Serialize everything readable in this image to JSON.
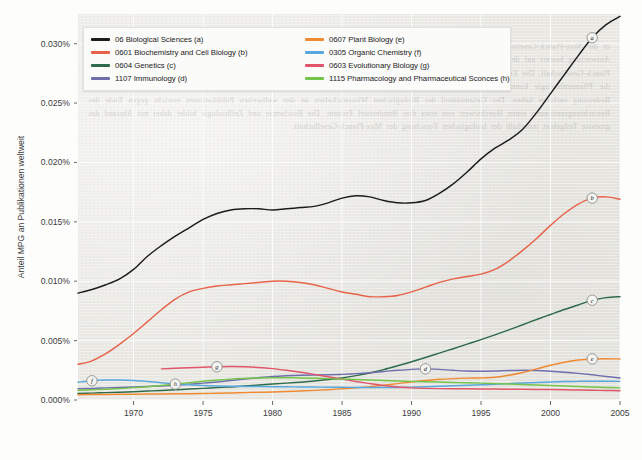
{
  "chart_data": {
    "type": "line",
    "title": "",
    "xlabel": "",
    "ylabel": "Anteil MPG an Publikationen weltweit",
    "xlim": [
      1966,
      2005
    ],
    "ylim": [
      0.0,
      0.0325
    ],
    "grid": true,
    "legend_position": "top-left inside plot",
    "x_ticks": [
      "1970",
      "1975",
      "1980",
      "1985",
      "1990",
      "1995",
      "2000",
      "2005"
    ],
    "x_tick_values": [
      1970,
      1975,
      1980,
      1985,
      1990,
      1995,
      2000,
      2005
    ],
    "y_ticks": [
      "0.000%",
      "0.005%",
      "0.010%",
      "0.015%",
      "0.020%",
      "0.025%",
      "0.030%"
    ],
    "y_tick_values": [
      0.0,
      0.005,
      0.01,
      0.015,
      0.02,
      0.025,
      0.03
    ],
    "x": [
      1966,
      1967,
      1968,
      1969,
      1970,
      1971,
      1972,
      1973,
      1974,
      1975,
      1976,
      1977,
      1978,
      1979,
      1980,
      1981,
      1982,
      1983,
      1984,
      1985,
      1986,
      1987,
      1988,
      1989,
      1990,
      1991,
      1992,
      1993,
      1994,
      1995,
      1996,
      1997,
      1998,
      1999,
      2000,
      2001,
      2002,
      2003,
      2004,
      2005
    ],
    "series": [
      {
        "key": "a",
        "name": "06 Biological Sciences (a)",
        "code": "06",
        "label_letter": "a",
        "color": "#1c1c1c",
        "marker_at": 2003,
        "values": [
          0.009,
          0.0093,
          0.0097,
          0.0102,
          0.011,
          0.0121,
          0.013,
          0.0138,
          0.0145,
          0.0152,
          0.0157,
          0.016,
          0.0161,
          0.0161,
          0.016,
          0.0161,
          0.0162,
          0.0163,
          0.0166,
          0.017,
          0.0172,
          0.0171,
          0.0168,
          0.0166,
          0.0166,
          0.0168,
          0.0174,
          0.0182,
          0.0192,
          0.0203,
          0.0212,
          0.0219,
          0.0228,
          0.0242,
          0.0258,
          0.0274,
          0.029,
          0.0305,
          0.0316,
          0.0323
        ]
      },
      {
        "key": "b",
        "name": "0601 Biochemistry and Cell Biology (b)",
        "code": "0601",
        "label_letter": "b",
        "color": "#e8624a",
        "marker_at": 2003,
        "values": [
          0.003,
          0.0033,
          0.0039,
          0.0047,
          0.0056,
          0.0066,
          0.0076,
          0.0085,
          0.0091,
          0.0094,
          0.0096,
          0.0097,
          0.0098,
          0.0099,
          0.01,
          0.01,
          0.0099,
          0.0097,
          0.0094,
          0.0091,
          0.0089,
          0.0087,
          0.0087,
          0.0088,
          0.0091,
          0.0095,
          0.0099,
          0.0102,
          0.0104,
          0.0106,
          0.011,
          0.0117,
          0.0126,
          0.0136,
          0.0147,
          0.0157,
          0.0165,
          0.017,
          0.0171,
          0.0169
        ]
      },
      {
        "key": "c",
        "name": "0604 Genetics (c)",
        "code": "0604",
        "label_letter": "c",
        "color": "#2e6b4a",
        "marker_at": 2003,
        "values": [
          0.00055,
          0.00058,
          0.00062,
          0.00066,
          0.0007,
          0.00075,
          0.0008,
          0.00086,
          0.00092,
          0.00098,
          0.00104,
          0.0011,
          0.00118,
          0.00126,
          0.00134,
          0.00142,
          0.0015,
          0.0016,
          0.00172,
          0.00186,
          0.00205,
          0.00228,
          0.00256,
          0.00288,
          0.00322,
          0.00358,
          0.00395,
          0.00432,
          0.0047,
          0.00508,
          0.00548,
          0.0059,
          0.00634,
          0.00678,
          0.0072,
          0.00762,
          0.008,
          0.0084,
          0.00862,
          0.0087
        ]
      },
      {
        "key": "d",
        "name": "1107 Immunology (d)",
        "code": "1107",
        "label_letter": "d",
        "color": "#6f6fae",
        "marker_at": 1991,
        "values": [
          0.00095,
          0.00098,
          0.00102,
          0.00106,
          0.0011,
          0.00114,
          0.00118,
          0.00124,
          0.00132,
          0.00142,
          0.00152,
          0.00164,
          0.00176,
          0.00188,
          0.00198,
          0.00204,
          0.00208,
          0.0021,
          0.00212,
          0.00216,
          0.00222,
          0.0023,
          0.0024,
          0.0025,
          0.00258,
          0.00262,
          0.00258,
          0.0025,
          0.00244,
          0.00242,
          0.00244,
          0.00248,
          0.0025,
          0.00248,
          0.00242,
          0.00234,
          0.00224,
          0.00212,
          0.00198,
          0.00186
        ]
      },
      {
        "key": "e",
        "name": "0607 Plant Biology (e)",
        "code": "0607",
        "label_letter": "e",
        "color": "#ef8a33",
        "marker_at": 2003,
        "values": [
          0.00045,
          0.00046,
          0.00047,
          0.00048,
          0.00049,
          0.0005,
          0.00051,
          0.00052,
          0.00053,
          0.00055,
          0.00057,
          0.00059,
          0.00062,
          0.00065,
          0.00068,
          0.00072,
          0.00076,
          0.00081,
          0.00087,
          0.00094,
          0.00102,
          0.00112,
          0.00124,
          0.00138,
          0.00152,
          0.00164,
          0.00174,
          0.0018,
          0.00184,
          0.00186,
          0.00192,
          0.00208,
          0.00232,
          0.00262,
          0.00292,
          0.00318,
          0.00336,
          0.00346,
          0.00348,
          0.00346
        ]
      },
      {
        "key": "f",
        "name": "0305 Organic Chemistry (f)",
        "code": "0305",
        "label_letter": "f",
        "color": "#59a8dd",
        "marker_at": 1967,
        "values": [
          0.0015,
          0.00162,
          0.00168,
          0.00168,
          0.00164,
          0.00156,
          0.00146,
          0.00136,
          0.00128,
          0.00122,
          0.00118,
          0.00116,
          0.00114,
          0.00113,
          0.00112,
          0.00111,
          0.0011,
          0.00109,
          0.00108,
          0.00107,
          0.00106,
          0.00105,
          0.00105,
          0.00106,
          0.00108,
          0.00112,
          0.00116,
          0.0012,
          0.00124,
          0.00128,
          0.00133,
          0.00138,
          0.00143,
          0.00148,
          0.00152,
          0.00155,
          0.00157,
          0.00158,
          0.00158,
          0.00157
        ]
      },
      {
        "key": "g",
        "name": "0603 Evolutionary Biology (g)",
        "code": "0603",
        "label_letter": "g",
        "color": "#e0556a",
        "marker_at": 1976,
        "values": [
          null,
          null,
          null,
          null,
          null,
          null,
          0.00262,
          0.00268,
          0.00272,
          0.00276,
          0.0028,
          0.00282,
          0.0028,
          0.00274,
          0.00264,
          0.0025,
          0.00234,
          0.00216,
          0.00196,
          0.00176,
          0.00156,
          0.00138,
          0.00122,
          0.0011,
          0.00102,
          0.00098,
          0.00096,
          0.00095,
          0.00094,
          0.00093,
          0.00092,
          0.00091,
          0.0009,
          0.00089,
          0.00088,
          0.00086,
          0.00084,
          0.00082,
          0.0008,
          0.00078
        ]
      },
      {
        "key": "h",
        "name": "1115 Pharmacology and Pharmaceutical Sconces (h)",
        "code": "1115",
        "label_letter": "h",
        "color": "#74c34a",
        "marker_at": 1973,
        "values": [
          0.00082,
          0.00086,
          0.0009,
          0.00096,
          0.00104,
          0.00112,
          0.00122,
          0.00134,
          0.00146,
          0.00158,
          0.00168,
          0.00176,
          0.00182,
          0.00186,
          0.00188,
          0.00188,
          0.00186,
          0.00183,
          0.0018,
          0.00176,
          0.00172,
          0.00168,
          0.00164,
          0.0016,
          0.00157,
          0.00154,
          0.00151,
          0.00148,
          0.00145,
          0.00142,
          0.00138,
          0.00134,
          0.0013,
          0.00126,
          0.00122,
          0.00118,
          0.00114,
          0.0011,
          0.00106,
          0.00102
        ]
      }
    ]
  },
  "ghost_text": "in der Max-Planck-Gesellschaft sowie der Anteil an den weltweiten Publikationen ist in den vergangenen Jahren deutlich gestiegen. Die Auswertung basiert auf den Daten des Science Citation Index und umfasst alle Publikationen mit mindestens einer Adresse aus der Max-Planck-Gesellschaft. Die Entwicklung der einzelnen Fachgebiete zeigt dabei sehr unterschiedliche Verlaufsmuster. Besonders die Genetik und die Pflanzenbiologie konnten ihre Anteile deutlich ausbauen, waehrend die Organische Chemie und die Evolutionsbiologie relativ an Bedeutung verloren haben. Der Gesamtanteil der Biologischen Wissenschaften an den weltweiten Publikationen erreicht gegen Ende des Betrachtungszeitraums einen Hoechstwert von etwa drei Hundertstel Prozent. Die Biochemie und Zellbiologie bildet dabei mit Abstand das groesste Teilgebiet innerhalb der biologischen Forschung der Max-Planck-Gesellschaft."
}
